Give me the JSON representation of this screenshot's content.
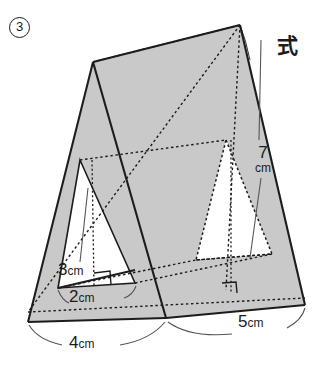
{
  "figure": {
    "index_label": "3",
    "annotation_shiki": "式",
    "fill_color": "#c9c9c9",
    "hole_color": "#ffffff",
    "stroke_color": "#1c1c1c",
    "background": "#ffffff",
    "type": "triangular-prism-with-triangular-hole",
    "dimensions": [
      {
        "id": "height-back",
        "value": "7",
        "unit": "cm",
        "style": "solid-leader"
      },
      {
        "id": "height-inner-triangle",
        "value": "3",
        "unit": "cm",
        "style": "solid-leader"
      },
      {
        "id": "base-inner-triangle",
        "value": "2",
        "unit": "cm",
        "style": "arc"
      },
      {
        "id": "base-outer-triangle",
        "value": "4",
        "unit": "cm",
        "style": "arc"
      },
      {
        "id": "prism-length",
        "value": "5",
        "unit": "cm",
        "style": "arc"
      }
    ],
    "labels": {
      "seven_num": "7",
      "seven_unit": "cm",
      "three_num": "3",
      "three_unit": "cm",
      "two_num": "2",
      "two_unit": "cm",
      "four_num": "4",
      "four_unit": "cm",
      "five_num": "5",
      "five_unit": "cm"
    }
  }
}
